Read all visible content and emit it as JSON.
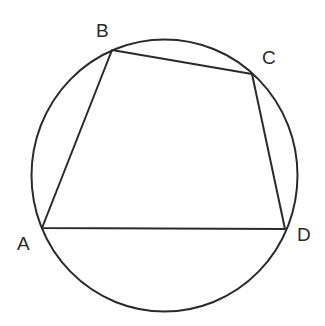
{
  "diagram": {
    "circle": {
      "cx": 164.5,
      "cy": 175.5,
      "rx": 133,
      "ry": 136
    },
    "vertices": {
      "A": {
        "x": 42,
        "y": 228
      },
      "B": {
        "x": 112,
        "y": 50
      },
      "C": {
        "x": 252,
        "y": 74
      },
      "D": {
        "x": 285,
        "y": 229
      }
    },
    "labels": [
      {
        "id": "A",
        "text": "A",
        "x": 17,
        "y": 250
      },
      {
        "id": "B",
        "text": "B",
        "x": 96,
        "y": 37
      },
      {
        "id": "C",
        "text": "C",
        "x": 262,
        "y": 64
      },
      {
        "id": "D",
        "text": "D",
        "x": 297,
        "y": 241
      }
    ],
    "edges": [
      "AB",
      "BC",
      "CD",
      "DA"
    ],
    "stroke_color": "#2a2a2a",
    "background": "#ffffff"
  }
}
